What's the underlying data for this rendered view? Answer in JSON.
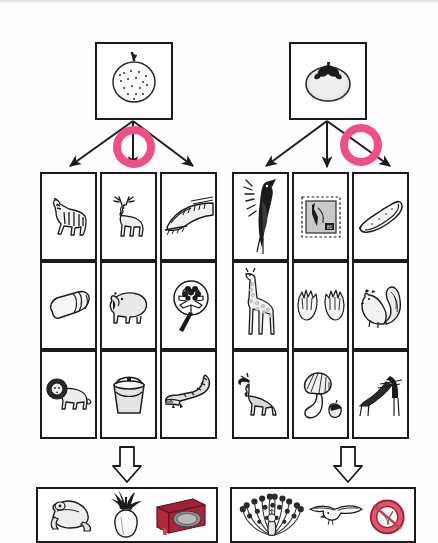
{
  "worksheet": {
    "title": "Picture classification worksheet",
    "annotation_color": "#F04E87",
    "line_color": "#1b1b1b",
    "background": "#ffffff"
  },
  "groups": [
    {
      "id": "left-group",
      "header": {
        "icon": "apple-icon",
        "label": "apple",
        "description": "round dotted fruit with short stem"
      },
      "branch_arrows": [
        {
          "id": "left-arrow-1",
          "direction": "down-left",
          "circled": false
        },
        {
          "id": "left-arrow-2",
          "direction": "down",
          "circled": true
        },
        {
          "id": "left-arrow-3",
          "direction": "down-right",
          "circled": false
        }
      ],
      "annotation": {
        "shape": "circle",
        "target": "left-arrow-2",
        "color": "#F04E87"
      },
      "grid": {
        "columns": 3,
        "rows": 3,
        "cells": [
          {
            "icon": "zebra-icon",
            "label": "zebra",
            "col": 1,
            "row": 1
          },
          {
            "icon": "deer-icon",
            "label": "deer",
            "col": 2,
            "row": 1
          },
          {
            "icon": "bullet-train-icon",
            "label": "bullet train",
            "col": 3,
            "row": 1
          },
          {
            "icon": "eraser-icon",
            "label": "eraser",
            "col": 1,
            "row": 2
          },
          {
            "icon": "hippo-icon",
            "label": "hippopotamus",
            "col": 2,
            "row": 2
          },
          {
            "icon": "flower-fan-icon",
            "label": "flower fan",
            "col": 3,
            "row": 2
          },
          {
            "icon": "lion-icon",
            "label": "lion",
            "col": 1,
            "row": 3
          },
          {
            "icon": "bucket-icon",
            "label": "bucket",
            "col": 2,
            "row": 3
          },
          {
            "icon": "crocodile-icon",
            "label": "crocodile",
            "col": 3,
            "row": 3
          }
        ]
      },
      "flow_arrow": {
        "icon": "hollow-down-arrow-icon",
        "glyph": "down"
      },
      "result": {
        "items": [
          {
            "icon": "frog-icon",
            "label": "frog"
          },
          {
            "icon": "turnip-icon",
            "label": "turnip"
          },
          {
            "icon": "red-box-icon",
            "label": "red box",
            "color": "#B5253F"
          }
        ]
      }
    },
    {
      "id": "right-group",
      "header": {
        "icon": "persimmon-icon",
        "label": "persimmon",
        "description": "round fruit with dark calyx leaves"
      },
      "branch_arrows": [
        {
          "id": "right-arrow-1",
          "direction": "down-left",
          "circled": false
        },
        {
          "id": "right-arrow-2",
          "direction": "down",
          "circled": false
        },
        {
          "id": "right-arrow-3",
          "direction": "down-right",
          "circled": true
        }
      ],
      "annotation": {
        "shape": "circle",
        "target": "right-arrow-3",
        "color": "#F04E87"
      },
      "grid": {
        "columns": 3,
        "rows": 3,
        "cells": [
          {
            "icon": "woodpecker-icon",
            "label": "woodpecker",
            "col": 1,
            "row": 1
          },
          {
            "icon": "postage-stamp-icon",
            "label": "postage stamp",
            "col": 2,
            "row": 1
          },
          {
            "icon": "cucumber-icon",
            "label": "cucumber",
            "col": 3,
            "row": 1
          },
          {
            "icon": "giraffe-icon",
            "label": "giraffe",
            "col": 1,
            "row": 2
          },
          {
            "icon": "gloves-icon",
            "label": "gloves",
            "col": 2,
            "row": 2
          },
          {
            "icon": "squirrel-icon",
            "label": "squirrel",
            "col": 3,
            "row": 2
          },
          {
            "icon": "moose-icon",
            "label": "moose",
            "col": 1,
            "row": 3
          },
          {
            "icon": "shellfish-acorn-icon",
            "label": "shellfish and acorn",
            "col": 2,
            "row": 3
          },
          {
            "icon": "slide-icon",
            "label": "playground slide",
            "col": 3,
            "row": 3
          }
        ]
      },
      "flow_arrow": {
        "icon": "hollow-down-arrow-icon",
        "glyph": "down"
      },
      "result": {
        "items": [
          {
            "icon": "peacock-icon",
            "label": "peacock"
          },
          {
            "icon": "seagull-icon",
            "label": "seagull"
          },
          {
            "icon": "red-round-icon",
            "label": "red round object",
            "color": "#D8385C"
          }
        ]
      }
    }
  ]
}
